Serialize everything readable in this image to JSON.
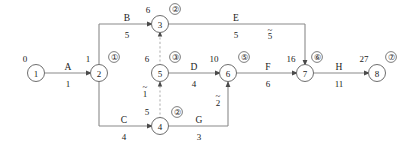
{
  "diagram": {
    "kind": "activity-on-arrow-network",
    "title": "",
    "colors": {
      "edge": "#8a8a8a",
      "dummy": "#b4b4b4",
      "node_stroke": "#6e6e6e",
      "text": "#1a1a1a",
      "background": "#ffffff"
    },
    "nodes": [
      {
        "id": "n1",
        "label": "1",
        "time": "0",
        "marker": "",
        "x": 36,
        "y": 73
      },
      {
        "id": "n2",
        "label": "2",
        "time": "1",
        "marker": "①",
        "x": 99,
        "y": 73
      },
      {
        "id": "n3",
        "label": "3",
        "time": "6",
        "marker": "②",
        "x": 160,
        "y": 24
      },
      {
        "id": "n5",
        "label": "5",
        "time": "6",
        "marker": "③",
        "x": 160,
        "y": 73
      },
      {
        "id": "n4",
        "label": "4",
        "time": "5",
        "marker": "②",
        "x": 160,
        "y": 126
      },
      {
        "id": "n6",
        "label": "6",
        "time": "10",
        "marker": "⑤",
        "x": 228,
        "y": 73
      },
      {
        "id": "n7",
        "label": "7",
        "time": "16",
        "marker": "⑥",
        "x": 305,
        "y": 73
      },
      {
        "id": "n8",
        "label": "8",
        "time": "27",
        "marker": "⑦",
        "x": 377,
        "y": 73
      }
    ],
    "activities": [
      {
        "id": "A",
        "name": "A",
        "duration": "1",
        "from": "n1",
        "to": "n2"
      },
      {
        "id": "B",
        "name": "B",
        "duration": "5",
        "from": "n2",
        "to": "n3"
      },
      {
        "id": "C",
        "name": "C",
        "duration": "4",
        "from": "n2",
        "to": "n4"
      },
      {
        "id": "D",
        "name": "D",
        "duration": "4",
        "from": "n5",
        "to": "n6"
      },
      {
        "id": "E",
        "name": "E",
        "duration": "5",
        "from": "n3",
        "to": "n7",
        "slack": "5"
      },
      {
        "id": "F",
        "name": "F",
        "duration": "6",
        "from": "n6",
        "to": "n7"
      },
      {
        "id": "G",
        "name": "G",
        "duration": "3",
        "from": "n4",
        "to": "n6",
        "slack": "2"
      },
      {
        "id": "H",
        "name": "H",
        "duration": "11",
        "from": "n7",
        "to": "n8"
      }
    ],
    "dummies": [
      {
        "id": "d45",
        "from": "n4",
        "to": "n5",
        "slack": "1"
      },
      {
        "id": "d53",
        "from": "n5",
        "to": "n3",
        "slack": ""
      }
    ],
    "labels": {
      "act_A": "A",
      "dur_A": "1",
      "act_B": "B",
      "dur_B": "5",
      "act_C": "C",
      "dur_C": "4",
      "act_D": "D",
      "dur_D": "4",
      "act_E": "E",
      "dur_E": "5",
      "slack_E": "5",
      "act_F": "F",
      "dur_F": "6",
      "act_G": "G",
      "dur_G": "3",
      "slack_G": "2",
      "act_H": "H",
      "dur_H": "11",
      "slack_dummy_45": "1",
      "node1_label": "1",
      "node1_time": "0",
      "node2_label": "2",
      "node2_time": "1",
      "node2_marker": "①",
      "node3_label": "3",
      "node3_time": "6",
      "node3_marker": "②",
      "node4_label": "4",
      "node4_time": "5",
      "node4_marker": "②",
      "node5_label": "5",
      "node5_time": "6",
      "node5_marker": "③",
      "node6_label": "6",
      "node6_time": "10",
      "node6_marker": "⑤",
      "node7_label": "7",
      "node7_time": "16",
      "node7_marker": "⑥",
      "node8_label": "8",
      "node8_time": "27",
      "node8_marker": "⑦"
    }
  }
}
